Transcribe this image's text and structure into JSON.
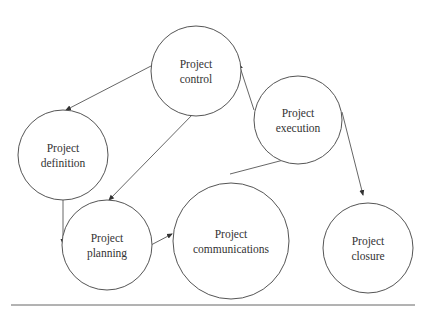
{
  "diagram": {
    "type": "process-cycle",
    "colors": {
      "stroke": "#555555",
      "text": "#333333",
      "background": "#ffffff"
    },
    "nodes": [
      {
        "id": "control",
        "lines": [
          "Project",
          "control"
        ],
        "cx": 196,
        "cy": 71,
        "r": 45
      },
      {
        "id": "definition",
        "lines": [
          "Project",
          "definition"
        ],
        "cx": 63,
        "cy": 155,
        "r": 45
      },
      {
        "id": "planning",
        "lines": [
          "Project",
          "planning"
        ],
        "cx": 107,
        "cy": 245,
        "r": 45
      },
      {
        "id": "communications",
        "lines": [
          "Project",
          "communications"
        ],
        "cx": 231,
        "cy": 241,
        "r": 58
      },
      {
        "id": "execution",
        "lines": [
          "Project",
          "execution"
        ],
        "cx": 298,
        "cy": 120,
        "r": 44
      },
      {
        "id": "closure",
        "lines": [
          "Project",
          "closure"
        ],
        "cx": 368,
        "cy": 248,
        "r": 45
      }
    ],
    "edges": [
      {
        "from": "control",
        "to": "definition",
        "x1": 151,
        "y1": 66,
        "x2": 66,
        "y2": 110
      },
      {
        "from": "control",
        "to": "planning",
        "x1": 195,
        "y1": 112,
        "x2": 109,
        "y2": 200
      },
      {
        "from": "definition",
        "to": "planning",
        "x1": 63,
        "y1": 200,
        "x2": 63,
        "y2": 244
      },
      {
        "from": "planning",
        "to": "communications",
        "x1": 151,
        "y1": 245,
        "x2": 172,
        "y2": 234
      },
      {
        "from": "communications",
        "to": "execution",
        "x1": 230,
        "y1": 174,
        "x2": 295,
        "y2": 157
      },
      {
        "from": "execution",
        "to": "control",
        "x1": 254,
        "y1": 110,
        "x2": 239,
        "y2": 64
      },
      {
        "from": "execution",
        "to": "closure",
        "x1": 342,
        "y1": 112,
        "x2": 363,
        "y2": 195
      }
    ],
    "rule": {
      "x1": 11,
      "y1": 305,
      "x2": 415,
      "y2": 305
    }
  }
}
